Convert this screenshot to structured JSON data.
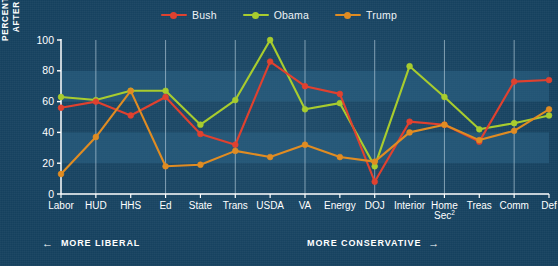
{
  "chart_data": {
    "type": "line",
    "title": "",
    "xlabel": "",
    "ylabel": "PERCENTAGE FILLED AFTER 7 MONTHS",
    "ylabel_lines": [
      "PERCENTAGE FILLED",
      "AFTER 7 MONTHS"
    ],
    "ylim": [
      0,
      100
    ],
    "yticks": [
      0,
      20,
      40,
      60,
      80,
      100
    ],
    "ytick_labels": [
      "0",
      "20",
      "40",
      "60",
      "80",
      "100"
    ],
    "grid": "vertical white gridlines at alternating categories; light horizontal bands at 20-40 and 60-80",
    "legend_position": "top-center",
    "categories": [
      "Labor",
      "HUD",
      "HHS",
      "Ed",
      "State",
      "Trans",
      "USDA",
      "VA",
      "Energy",
      "DOJ",
      "Interior",
      "Home Sec²",
      "Treas",
      "Comm",
      "Def"
    ],
    "series": [
      {
        "name": "Bush",
        "color": "#e0412f",
        "values": [
          56,
          60,
          51,
          63,
          39,
          32,
          86,
          70,
          65,
          8,
          47,
          45,
          34,
          73,
          74
        ]
      },
      {
        "name": "Obama",
        "color": "#a8cc2e",
        "values": [
          63,
          61,
          67,
          67,
          45,
          61,
          100,
          55,
          59,
          18,
          83,
          63,
          42,
          46,
          51
        ]
      },
      {
        "name": "Trump",
        "color": "#e08c22",
        "values": [
          13,
          37,
          67,
          18,
          19,
          28,
          24,
          32,
          24,
          21,
          40,
          45,
          35,
          41,
          55
        ]
      }
    ],
    "annotations": [
      {
        "id": "more-liberal",
        "text": "MORE LIBERAL",
        "arrow": "left"
      },
      {
        "id": "more-conservative",
        "text": "MORE CONSERVATIVE",
        "arrow": "right"
      }
    ],
    "footnote_marker": "2"
  },
  "legend": {
    "items": [
      {
        "label": "Bush",
        "color": "#e0412f"
      },
      {
        "label": "Obama",
        "color": "#a8cc2e"
      },
      {
        "label": "Trump",
        "color": "#e08c22"
      }
    ]
  },
  "axis_captions": {
    "left": {
      "arrow": "←",
      "text": "MORE LIBERAL"
    },
    "right": {
      "text": "MORE CONSERVATIVE",
      "arrow": "→"
    }
  },
  "colors": {
    "background": "#164463",
    "band": "#2e6588",
    "gridline": "#c9dce8",
    "axis": "#ffffff",
    "text": "#ffffff",
    "bush": "#e0412f",
    "obama": "#a8cc2e",
    "trump": "#e08c22"
  }
}
